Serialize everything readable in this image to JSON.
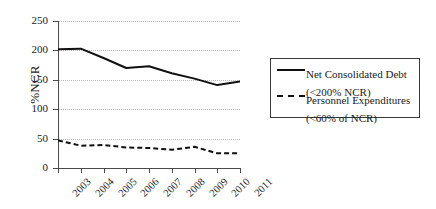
{
  "chart_data": {
    "type": "line",
    "title": "",
    "xlabel": "",
    "ylabel": "%NCR",
    "categories": [
      "2003",
      "2004",
      "2005",
      "2006",
      "2007",
      "2008",
      "2009",
      "2010",
      "2011"
    ],
    "ylim": [
      0,
      250
    ],
    "yticks": [
      0,
      50,
      100,
      150,
      200,
      250
    ],
    "grid": true,
    "legend_position": "right",
    "series": [
      {
        "name": "Net Consolidated Debt",
        "sublabel": "(<200% NCR)",
        "style": "solid",
        "color": "#111111",
        "values": [
          202,
          203,
          187,
          170,
          173,
          161,
          152,
          141,
          147
        ]
      },
      {
        "name": "Personnel Expenditures",
        "sublabel": "(<60% of NCR)",
        "style": "dashed",
        "color": "#111111",
        "values": [
          47,
          38,
          39,
          35,
          34,
          31,
          36,
          25,
          25
        ]
      }
    ]
  },
  "axes": {
    "y_title": "%NCR",
    "y_tick_labels": [
      "250",
      "200",
      "150",
      "100",
      "50",
      "0"
    ],
    "x_tick_labels": [
      "2003",
      "2004",
      "2005",
      "2006",
      "2007",
      "2008",
      "2009",
      "2010",
      "2011"
    ]
  },
  "legend": {
    "entries": [
      {
        "label": "Net Consolidated Debt",
        "sub": "(<200% NCR)",
        "sample": "solid-line-sample"
      },
      {
        "label": "Personnel Expenditures",
        "sub": "(<60% of NCR)",
        "sample": "dashed-line-sample"
      }
    ]
  },
  "colors": {
    "background": "#ffffff",
    "axis": "#4a4a4a",
    "grid": "#b9b9b9",
    "line": "#111111",
    "text": "#1a1a1a"
  }
}
